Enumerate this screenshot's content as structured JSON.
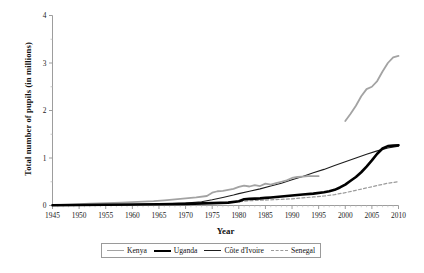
{
  "chart_data": {
    "type": "line",
    "title": "",
    "xlabel": "Year",
    "ylabel": "Total number of pupils (in millions)",
    "xlim": [
      1945,
      2010
    ],
    "ylim": [
      0,
      4
    ],
    "xticks": [
      1945,
      1950,
      1955,
      1960,
      1965,
      1970,
      1975,
      1980,
      1985,
      1990,
      1995,
      2000,
      2005,
      2010
    ],
    "yticks": [
      0,
      1,
      2,
      3,
      4
    ],
    "minor_yticks": [
      0.5,
      1.5,
      2.5,
      3.5
    ],
    "grid": false,
    "legend_position": "bottom",
    "series": [
      {
        "name": "Kenya",
        "color": "#a3a3a3",
        "style": "solid",
        "width": 1.8,
        "segments": [
          {
            "x": [
              1945,
              1948,
              1950,
              1952,
              1955,
              1958,
              1960,
              1962,
              1964,
              1966,
              1968,
              1970,
              1972,
              1974,
              1975,
              1976,
              1977,
              1978,
              1979,
              1980,
              1981,
              1982,
              1983,
              1984,
              1985,
              1986,
              1987,
              1988,
              1989,
              1990,
              1991,
              1992,
              1993,
              1994,
              1995
            ],
            "y": [
              0.01,
              0.02,
              0.03,
              0.04,
              0.05,
              0.06,
              0.07,
              0.08,
              0.09,
              0.11,
              0.13,
              0.15,
              0.17,
              0.2,
              0.27,
              0.3,
              0.31,
              0.33,
              0.35,
              0.39,
              0.42,
              0.4,
              0.43,
              0.41,
              0.46,
              0.44,
              0.47,
              0.5,
              0.53,
              0.58,
              0.6,
              0.61,
              0.62,
              0.62,
              0.62
            ]
          },
          {
            "x": [
              2000,
              2001,
              2002,
              2003,
              2004,
              2005,
              2006,
              2007,
              2008,
              2009,
              2010
            ],
            "y": [
              1.78,
              1.93,
              2.1,
              2.3,
              2.45,
              2.5,
              2.62,
              2.82,
              3.0,
              3.12,
              3.15
            ]
          }
        ]
      },
      {
        "name": "Uganda",
        "color": "#000000",
        "style": "solid",
        "width": 2.6,
        "segments": [
          {
            "x": [
              1945,
              1950,
              1955,
              1960,
              1965,
              1970,
              1975,
              1978,
              1980,
              1981,
              1982,
              1983,
              1984,
              1985,
              1986,
              1988,
              1990,
              1992,
              1994,
              1996,
              1997,
              1998,
              1999,
              2000,
              2001,
              2002,
              2003,
              2004,
              2005,
              2006,
              2007,
              2008,
              2009,
              2010
            ],
            "y": [
              0.005,
              0.01,
              0.015,
              0.02,
              0.025,
              0.035,
              0.05,
              0.06,
              0.09,
              0.13,
              0.14,
              0.145,
              0.15,
              0.16,
              0.17,
              0.19,
              0.21,
              0.23,
              0.25,
              0.28,
              0.3,
              0.33,
              0.38,
              0.44,
              0.52,
              0.6,
              0.7,
              0.82,
              0.95,
              1.09,
              1.2,
              1.25,
              1.26,
              1.27
            ]
          }
        ]
      },
      {
        "name": "Côte d'Ivoire",
        "color": "#1d1d1d",
        "style": "solid",
        "width": 1.1,
        "segments": [
          {
            "x": [
              1945,
              1950,
              1955,
              1960,
              1965,
              1970,
              1973,
              1975,
              1977,
              1979,
              1980,
              1982,
              1984,
              1986,
              1988,
              1990,
              1992,
              1994,
              1996,
              1998,
              2000,
              2002,
              2004,
              2006,
              2008,
              2010
            ],
            "y": [
              0.004,
              0.008,
              0.012,
              0.018,
              0.03,
              0.05,
              0.08,
              0.12,
              0.17,
              0.22,
              0.25,
              0.3,
              0.35,
              0.41,
              0.47,
              0.54,
              0.61,
              0.69,
              0.76,
              0.84,
              0.92,
              1.0,
              1.08,
              1.15,
              1.21,
              1.25
            ]
          }
        ]
      },
      {
        "name": "Senegal",
        "color": "#9b9b9b",
        "style": "dashed",
        "width": 1.2,
        "segments": [
          {
            "x": [
              1945,
              1950,
              1955,
              1960,
              1965,
              1970,
              1975,
              1980,
              1982,
              1984,
              1986,
              1988,
              1990,
              1992,
              1994,
              1996,
              1998,
              2000,
              2002,
              2004,
              2006,
              2008,
              2010
            ],
            "y": [
              0.003,
              0.006,
              0.01,
              0.015,
              0.02,
              0.03,
              0.05,
              0.08,
              0.1,
              0.11,
              0.12,
              0.13,
              0.14,
              0.16,
              0.18,
              0.2,
              0.23,
              0.27,
              0.32,
              0.37,
              0.42,
              0.47,
              0.5
            ]
          }
        ]
      }
    ],
    "legend": [
      {
        "label": "Kenya"
      },
      {
        "label": "Uganda"
      },
      {
        "label": "Côte d'Ivoire"
      },
      {
        "label": "Senegal"
      }
    ]
  }
}
